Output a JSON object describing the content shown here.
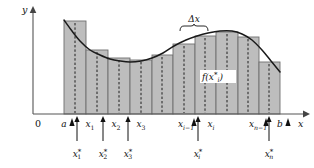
{
  "figure": {
    "background": "#ffffff",
    "width": 314,
    "height": 168
  },
  "axes": {
    "y_label": "y",
    "x_label": "x",
    "origin_label": "0",
    "origin_px": {
      "x": 33,
      "y": 114
    },
    "x_axis_end_px": 306,
    "y_axis_top_px": 10,
    "axis_color": "#555555"
  },
  "annotations": {
    "delta_x_label": "Δx",
    "function_value_label": "f(x",
    "function_value_star": "*",
    "function_value_sub": "i",
    "function_value_close": ")",
    "delta_x_brace_span_px": {
      "x1": 180,
      "x2": 208
    }
  },
  "partition_labels": [
    {
      "name": "a",
      "base": "a",
      "sub": "",
      "star": false,
      "x": 64
    },
    {
      "name": "x1",
      "base": "x",
      "sub": "1",
      "star": false,
      "x": 90
    },
    {
      "name": "x2",
      "base": "x",
      "sub": "2",
      "star": false,
      "x": 116
    },
    {
      "name": "x3",
      "base": "x",
      "sub": "3",
      "star": false,
      "x": 141
    },
    {
      "name": "xi-1",
      "base": "x",
      "sub": "i−1",
      "star": false,
      "x": 186
    },
    {
      "name": "xi",
      "base": "x",
      "sub": "i",
      "star": false,
      "x": 211
    },
    {
      "name": "xn-1",
      "base": "x",
      "sub": "n−1",
      "star": false,
      "x": 258
    },
    {
      "name": "b",
      "base": "b",
      "sub": "",
      "star": false,
      "x": 280
    }
  ],
  "sample_point_labels": [
    {
      "name": "x1star",
      "base": "x",
      "sub": "1",
      "x": 77
    },
    {
      "name": "x2star",
      "base": "x",
      "sub": "2",
      "x": 103
    },
    {
      "name": "x3star",
      "base": "x",
      "sub": "3",
      "x": 128
    },
    {
      "name": "xistar",
      "base": "x",
      "sub": "i",
      "x": 198
    },
    {
      "name": "xnstar",
      "base": "x",
      "sub": "n",
      "x": 269
    }
  ],
  "chart_data": {
    "type": "area",
    "xlabel": "x",
    "ylabel": "y",
    "grid": false,
    "legend": null,
    "baseline_y_px": 114,
    "interval": {
      "a_px": 64,
      "b_px": 280
    },
    "n_rectangles": 10,
    "rectangle_edges_px": [
      64,
      86,
      108,
      130,
      152,
      173,
      195,
      216,
      238,
      259,
      280
    ],
    "rectangles": [
      {
        "index": 1,
        "x0_px": 64,
        "x1_px": 86,
        "top_px": 21,
        "height_px": 93
      },
      {
        "index": 2,
        "x0_px": 86,
        "x1_px": 108,
        "top_px": 50,
        "height_px": 64
      },
      {
        "index": 3,
        "x0_px": 108,
        "x1_px": 130,
        "top_px": 58,
        "height_px": 56
      },
      {
        "index": 4,
        "x0_px": 130,
        "x1_px": 152,
        "top_px": 60,
        "height_px": 54
      },
      {
        "index": 5,
        "x0_px": 152,
        "x1_px": 173,
        "top_px": 55,
        "height_px": 59
      },
      {
        "index": 6,
        "x0_px": 173,
        "x1_px": 195,
        "top_px": 44,
        "height_px": 70
      },
      {
        "index": 7,
        "x0_px": 195,
        "x1_px": 216,
        "top_px": 36,
        "height_px": 78
      },
      {
        "index": 8,
        "x0_px": 216,
        "x1_px": 238,
        "top_px": 32,
        "height_px": 82
      },
      {
        "index": 9,
        "x0_px": 238,
        "x1_px": 259,
        "top_px": 37,
        "height_px": 77
      },
      {
        "index": 10,
        "x0_px": 259,
        "x1_px": 280,
        "top_px": 62,
        "height_px": 52
      }
    ],
    "sample_points_px": [
      75,
      97,
      119,
      141,
      162,
      184,
      205,
      227,
      248,
      269
    ],
    "curve_points_px": [
      {
        "x": 64,
        "y": 20
      },
      {
        "x": 72,
        "y": 31
      },
      {
        "x": 80,
        "y": 41
      },
      {
        "x": 90,
        "y": 50
      },
      {
        "x": 100,
        "y": 55
      },
      {
        "x": 110,
        "y": 59
      },
      {
        "x": 120,
        "y": 61
      },
      {
        "x": 130,
        "y": 62
      },
      {
        "x": 141,
        "y": 61
      },
      {
        "x": 152,
        "y": 58
      },
      {
        "x": 163,
        "y": 53
      },
      {
        "x": 174,
        "y": 46
      },
      {
        "x": 186,
        "y": 40
      },
      {
        "x": 197,
        "y": 36
      },
      {
        "x": 208,
        "y": 33
      },
      {
        "x": 220,
        "y": 31
      },
      {
        "x": 232,
        "y": 31
      },
      {
        "x": 242,
        "y": 34
      },
      {
        "x": 252,
        "y": 40
      },
      {
        "x": 262,
        "y": 50
      },
      {
        "x": 271,
        "y": 61
      },
      {
        "x": 280,
        "y": 72
      }
    ],
    "bar_fill_color": "#b9b9b9",
    "bar_stroke_color": "#6f6f6f",
    "curve_color": "#1a1a1a"
  }
}
